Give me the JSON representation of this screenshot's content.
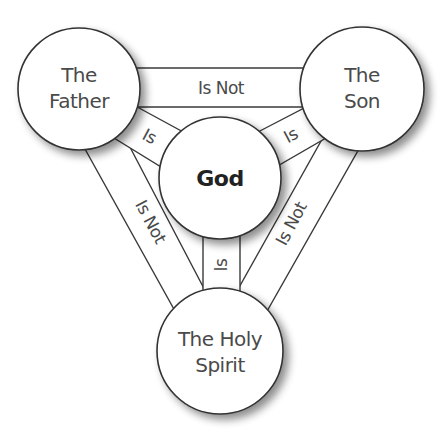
{
  "diagram": {
    "type": "shield-of-the-trinity",
    "nodes": {
      "father": {
        "line1": "The",
        "line2": "Father"
      },
      "son": {
        "line1": "The",
        "line2": "Son"
      },
      "god": {
        "label": "God"
      },
      "spirit": {
        "line1": "The Holy",
        "line2": "Spirit"
      }
    },
    "edges": {
      "father_son": "Is Not",
      "father_spirit": "Is Not",
      "son_spirit": "Is Not",
      "father_god": "Is",
      "son_god": "Is",
      "spirit_god": "Is"
    },
    "colors": {
      "stroke": "#333333",
      "fill": "#ffffff",
      "text": "#4a4a4a",
      "shadow": "#9a9a9a"
    }
  }
}
